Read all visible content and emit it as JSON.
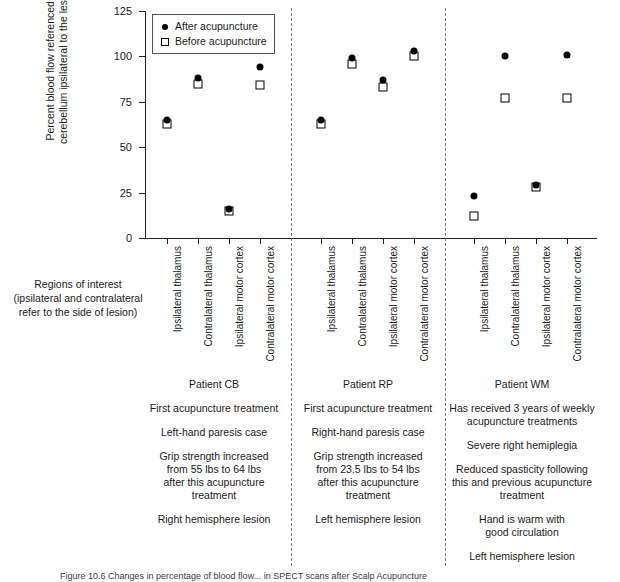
{
  "chart_data": {
    "type": "scatter",
    "title": "",
    "ylabel": "Percent blood flow referenced to cerebellum ipsilateral to the lesion",
    "xlabel": "Regions of interest (ipsilateral and contralateral refer to the side of lesion)",
    "ylim": [
      0,
      125
    ],
    "yticks": [
      0,
      25,
      50,
      75,
      100,
      125
    ],
    "grid": false,
    "legend_position": "top-left",
    "legend": [
      {
        "label": "After acupuncture",
        "marker": "filled-circle"
      },
      {
        "label": "Before acupuncture",
        "marker": "open-square"
      }
    ],
    "categories": [
      "Ipsilateral thalamus",
      "Contralateral thalamus",
      "Ipsilateral motor cortex",
      "Contralateral motor cortex"
    ],
    "groups": [
      {
        "name": "Patient CB",
        "series": [
          {
            "name": "After acupuncture",
            "values": [
              65,
              88,
              16,
              94
            ]
          },
          {
            "name": "Before acupuncture",
            "values": [
              63,
              85,
              15,
              84
            ]
          }
        ]
      },
      {
        "name": "Patient RP",
        "series": [
          {
            "name": "After acupuncture",
            "values": [
              65,
              99,
              87,
              103
            ]
          },
          {
            "name": "Before acupuncture",
            "values": [
              63,
              96,
              83,
              100
            ]
          }
        ]
      },
      {
        "name": "Patient WM",
        "series": [
          {
            "name": "After acupuncture",
            "values": [
              23,
              100,
              29,
              101
            ]
          },
          {
            "name": "Before acupuncture",
            "values": [
              12,
              77,
              28,
              77
            ]
          }
        ]
      }
    ]
  },
  "axis": {
    "y_title_line1": "Percent blood flow referenced to",
    "y_title_line2": "cerebellum ipsilateral to the lesion",
    "tick_labels": [
      "125",
      "100",
      "75",
      "50",
      "25",
      "0"
    ]
  },
  "roi_caption": {
    "line1": "Regions of interest",
    "line2": "(ipsilateral and contralateral",
    "line3": "refer to the side of lesion)"
  },
  "patients": [
    {
      "title": "Patient CB",
      "paragraphs": [
        "First acupuncture treatment",
        "Left-hand paresis case",
        "Grip strength increased\nfrom 55 lbs to 64 lbs\nafter this acupuncture\ntreatment",
        "Right hemisphere lesion"
      ]
    },
    {
      "title": "Patient RP",
      "paragraphs": [
        "First acupuncture treatment",
        "Right-hand paresis case",
        "Grip strength increased\nfrom 23.5 lbs to 54 lbs\nafter this acupuncture\ntreatment",
        "Left hemisphere lesion"
      ]
    },
    {
      "title": "Patient WM",
      "paragraphs": [
        "Has received 3 years of weekly\nacupuncture treatments",
        "Severe right hemiplegia",
        "Reduced spasticity following\nthis and previous acupuncture\ntreatment",
        "Hand is warm with\ngood circulation",
        "Left hemisphere lesion"
      ]
    }
  ],
  "bottom_caption": {
    "text": "Figure 10.6  Changes in percentage of blood flow...   in SPECT scans after Scalp Acupuncture"
  },
  "colors": {
    "axis": "#222222",
    "marker_after": "#000000",
    "marker_before": "#ffffff",
    "separator": "#777777",
    "text": "#1a1a1a"
  }
}
